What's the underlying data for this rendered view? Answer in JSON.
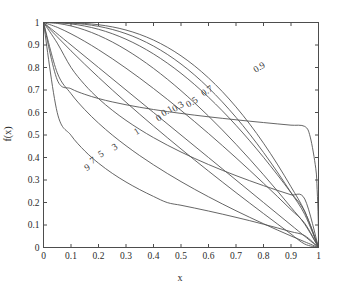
{
  "chart_data": {
    "type": "line",
    "title": "",
    "xlabel": "x",
    "ylabel": "f(x)",
    "xlim": [
      0,
      1
    ],
    "ylim": [
      0,
      1
    ],
    "grid": false,
    "legend": "inline-curve-labels",
    "xticks": [
      "0",
      "0.1",
      "0.2",
      "0.3",
      "0.4",
      "0.5",
      "0.6",
      "0.7",
      "0.8",
      "0.9",
      "1"
    ],
    "xtick_values": [
      0,
      0.1,
      0.2,
      0.3,
      0.4,
      0.5,
      0.6,
      0.7,
      0.8,
      0.9,
      1
    ],
    "yticks": [
      "0",
      "0.1",
      "0.2",
      "0.3",
      "0.4",
      "0.5",
      "0.6",
      "0.7",
      "0.8",
      "0.9",
      "1"
    ],
    "ytick_values": [
      0,
      0.1,
      0.2,
      0.3,
      0.4,
      0.5,
      0.6,
      0.7,
      0.8,
      0.9,
      1
    ],
    "line_color": "#555555",
    "series": [
      {
        "name": "0.9",
        "param": 0.9,
        "exponent": 0.1,
        "label_x": 0.79,
        "label_y": 0.79,
        "values": [
          [
            0,
            1
          ],
          [
            0.05,
            0.745
          ],
          [
            0.1,
            0.7057
          ],
          [
            0.15,
            0.6808
          ],
          [
            0.2,
            0.6621
          ],
          [
            0.25,
            0.6471
          ],
          [
            0.3,
            0.6343
          ],
          [
            0.35,
            0.6232
          ],
          [
            0.4,
            0.6132
          ],
          [
            0.45,
            0.6042
          ],
          [
            0.5,
            0.5959
          ],
          [
            0.55,
            0.5882
          ],
          [
            0.6,
            0.5809
          ],
          [
            0.65,
            0.5741
          ],
          [
            0.7,
            0.5676
          ],
          [
            0.75,
            0.5613
          ],
          [
            0.8,
            0.5553
          ],
          [
            0.85,
            0.5494
          ],
          [
            0.9,
            0.5437
          ],
          [
            0.95,
            0.5381
          ],
          [
            0.97,
            0.4909
          ],
          [
            0.99,
            0.3521
          ],
          [
            0.995,
            0.2583
          ],
          [
            0.999,
            0.1262
          ],
          [
            1,
            0
          ]
        ]
      },
      {
        "name": "0.7",
        "param": 0.7,
        "exponent": 0.3,
        "label_x": 0.6,
        "label_y": 0.685,
        "values": [
          [
            0,
            1
          ],
          [
            0.05,
            0.5994
          ],
          [
            0.1,
            0.4988
          ],
          [
            0.15,
            0.4292
          ],
          [
            0.2,
            0.3748
          ],
          [
            0.25,
            0.3297
          ],
          [
            0.3,
            0.2911
          ],
          [
            0.35,
            0.2572
          ],
          [
            0.4,
            0.227
          ],
          [
            0.45,
            0.1997
          ],
          [
            0.5,
            0.1878
          ],
          [
            0.55,
            0.1752
          ],
          [
            0.6,
            0.1621
          ],
          [
            0.65,
            0.1484
          ],
          [
            0.7,
            0.1341
          ],
          [
            0.75,
            0.1192
          ],
          [
            0.8,
            0.1036
          ],
          [
            0.85,
            0.0873
          ],
          [
            0.9,
            0.0703
          ],
          [
            0.95,
            0.0525
          ],
          [
            1,
            0
          ]
        ]
      },
      {
        "name": "0.5",
        "param": 0.5,
        "exponent": 0.5,
        "label_x": 0.545,
        "label_y": 0.635,
        "values": [
          [
            0,
            1
          ],
          [
            0.05,
            0.7764
          ],
          [
            0.1,
            0.6838
          ],
          [
            0.15,
            0.6127
          ],
          [
            0.2,
            0.5528
          ],
          [
            0.25,
            0.5
          ],
          [
            0.3,
            0.4523
          ],
          [
            0.35,
            0.4083
          ],
          [
            0.4,
            0.3675
          ],
          [
            0.45,
            0.3292
          ],
          [
            0.5,
            0.2929
          ],
          [
            0.55,
            0.2584
          ],
          [
            0.6,
            0.2254
          ],
          [
            0.65,
            0.1938
          ],
          [
            0.7,
            0.1633
          ],
          [
            0.75,
            0.134
          ],
          [
            0.8,
            0.1056
          ],
          [
            0.85,
            0.078
          ],
          [
            0.9,
            0.0513
          ],
          [
            0.95,
            0.0253
          ],
          [
            1,
            0
          ]
        ]
      },
      {
        "name": "0.3",
        "param": 0.3,
        "exponent": 0.7,
        "label_x": 0.495,
        "label_y": 0.615,
        "values": [
          [
            0,
            1
          ],
          [
            0.05,
            0.9083
          ],
          [
            0.1,
            0.8005
          ],
          [
            0.15,
            0.7234
          ],
          [
            0.2,
            0.6619
          ],
          [
            0.25,
            0.6101
          ],
          [
            0.3,
            0.565
          ],
          [
            0.35,
            0.5248
          ],
          [
            0.4,
            0.4884
          ],
          [
            0.45,
            0.4551
          ],
          [
            0.5,
            0.4243
          ],
          [
            0.55,
            0.3956
          ],
          [
            0.6,
            0.3687
          ],
          [
            0.65,
            0.3434
          ],
          [
            0.7,
            0.3194
          ],
          [
            0.75,
            0.2966
          ],
          [
            0.8,
            0.2749
          ],
          [
            0.85,
            0.2542
          ],
          [
            0.9,
            0.2344
          ],
          [
            0.95,
            0.2154
          ],
          [
            1,
            0
          ]
        ]
      },
      {
        "name": "0.1",
        "param": 0.1,
        "exponent": 0.9,
        "label_x": 0.455,
        "label_y": 0.595,
        "values": [
          [
            0,
            1
          ],
          [
            0.05,
            0.9363
          ],
          [
            0.1,
            0.8741
          ],
          [
            0.15,
            0.8143
          ],
          [
            0.2,
            0.7565
          ],
          [
            0.25,
            0.7003
          ],
          [
            0.3,
            0.6456
          ],
          [
            0.35,
            0.5921
          ],
          [
            0.4,
            0.5398
          ],
          [
            0.45,
            0.4885
          ],
          [
            0.5,
            0.438
          ],
          [
            0.55,
            0.3884
          ],
          [
            0.6,
            0.3396
          ],
          [
            0.65,
            0.2915
          ],
          [
            0.7,
            0.244
          ],
          [
            0.75,
            0.1972
          ],
          [
            0.8,
            0.1509
          ],
          [
            0.85,
            0.1052
          ],
          [
            0.9,
            0.06
          ],
          [
            0.95,
            0.0153
          ],
          [
            1,
            0
          ]
        ]
      },
      {
        "name": "0",
        "param": 0,
        "exponent": 1.0,
        "label_x": 0.425,
        "label_y": 0.565,
        "values": [
          [
            0,
            1
          ],
          [
            0.1,
            0.9
          ],
          [
            0.2,
            0.8
          ],
          [
            0.3,
            0.7
          ],
          [
            0.4,
            0.6
          ],
          [
            0.5,
            0.5
          ],
          [
            0.6,
            0.4
          ],
          [
            0.7,
            0.3
          ],
          [
            0.8,
            0.2
          ],
          [
            0.9,
            0.1
          ],
          [
            1,
            0
          ]
        ]
      },
      {
        "name": "1",
        "param": 1,
        "exponent": 1.45,
        "label_x": 0.345,
        "label_y": 0.505,
        "values": [
          [
            0,
            1
          ],
          [
            0.05,
            0.9786
          ],
          [
            0.1,
            0.9497
          ],
          [
            0.15,
            0.9161
          ],
          [
            0.2,
            0.879
          ],
          [
            0.25,
            0.8391
          ],
          [
            0.3,
            0.7969
          ],
          [
            0.35,
            0.7527
          ],
          [
            0.4,
            0.7066
          ],
          [
            0.45,
            0.6589
          ],
          [
            0.5,
            0.6096
          ],
          [
            0.55,
            0.5589
          ],
          [
            0.6,
            0.5068
          ],
          [
            0.65,
            0.4534
          ],
          [
            0.7,
            0.3987
          ],
          [
            0.75,
            0.3428
          ],
          [
            0.8,
            0.2857
          ],
          [
            0.85,
            0.2274
          ],
          [
            0.9,
            0.168
          ],
          [
            0.95,
            0.1074
          ],
          [
            1,
            0
          ]
        ]
      },
      {
        "name": "3",
        "param": 3,
        "exponent": 2.1,
        "label_x": 0.265,
        "label_y": 0.435,
        "values": [
          [
            0,
            1
          ],
          [
            0.05,
            0.996
          ],
          [
            0.1,
            0.9847
          ],
          [
            0.15,
            0.9668
          ],
          [
            0.2,
            0.9429
          ],
          [
            0.25,
            0.9135
          ],
          [
            0.3,
            0.8789
          ],
          [
            0.35,
            0.8397
          ],
          [
            0.4,
            0.7961
          ],
          [
            0.45,
            0.7484
          ],
          [
            0.5,
            0.697
          ],
          [
            0.55,
            0.6421
          ],
          [
            0.6,
            0.584
          ],
          [
            0.65,
            0.5228
          ],
          [
            0.7,
            0.4589
          ],
          [
            0.75,
            0.3923
          ],
          [
            0.8,
            0.3233
          ],
          [
            0.85,
            0.2521
          ],
          [
            0.9,
            0.1787
          ],
          [
            0.95,
            0.1034
          ],
          [
            1,
            0
          ]
        ]
      },
      {
        "name": "5",
        "param": 5,
        "exponent": 2.7,
        "label_x": 0.215,
        "label_y": 0.405,
        "values": [
          [
            0,
            1
          ],
          [
            0.05,
            0.9989
          ],
          [
            0.1,
            0.9938
          ],
          [
            0.15,
            0.9842
          ],
          [
            0.2,
            0.9698
          ],
          [
            0.25,
            0.9503
          ],
          [
            0.3,
            0.9256
          ],
          [
            0.35,
            0.8956
          ],
          [
            0.4,
            0.8603
          ],
          [
            0.45,
            0.8198
          ],
          [
            0.5,
            0.7742
          ],
          [
            0.55,
            0.7235
          ],
          [
            0.6,
            0.668
          ],
          [
            0.65,
            0.6078
          ],
          [
            0.7,
            0.5431
          ],
          [
            0.75,
            0.4741
          ],
          [
            0.8,
            0.401
          ],
          [
            0.85,
            0.324
          ],
          [
            0.9,
            0.2434
          ],
          [
            0.95,
            0.1594
          ],
          [
            1,
            0
          ]
        ]
      },
      {
        "name": "7",
        "param": 7,
        "exponent": 3.3,
        "label_x": 0.185,
        "label_y": 0.375,
        "values": [
          [
            0,
            1
          ],
          [
            0.05,
            0.9996
          ],
          [
            0.1,
            0.9973
          ],
          [
            0.15,
            0.992
          ],
          [
            0.2,
            0.9829
          ],
          [
            0.25,
            0.9692
          ],
          [
            0.3,
            0.9503
          ],
          [
            0.35,
            0.9258
          ],
          [
            0.4,
            0.8953
          ],
          [
            0.45,
            0.8586
          ],
          [
            0.5,
            0.8155
          ],
          [
            0.55,
            0.7659
          ],
          [
            0.6,
            0.7098
          ],
          [
            0.65,
            0.6473
          ],
          [
            0.7,
            0.5785
          ],
          [
            0.75,
            0.5035
          ],
          [
            0.8,
            0.4226
          ],
          [
            0.85,
            0.336
          ],
          [
            0.9,
            0.244
          ],
          [
            0.95,
            0.1469
          ],
          [
            1,
            0
          ]
        ]
      },
      {
        "name": "9",
        "param": 9,
        "exponent": 3.9,
        "label_x": 0.165,
        "label_y": 0.345,
        "values": [
          [
            0,
            1
          ],
          [
            0.05,
            0.9998
          ],
          [
            0.1,
            0.9988
          ],
          [
            0.15,
            0.9958
          ],
          [
            0.2,
            0.9901
          ],
          [
            0.25,
            0.9806
          ],
          [
            0.3,
            0.9665
          ],
          [
            0.35,
            0.9471
          ],
          [
            0.4,
            0.9219
          ],
          [
            0.45,
            0.8903
          ],
          [
            0.5,
            0.852
          ],
          [
            0.55,
            0.8066
          ],
          [
            0.6,
            0.7537
          ],
          [
            0.65,
            0.6932
          ],
          [
            0.7,
            0.6248
          ],
          [
            0.75,
            0.5483
          ],
          [
            0.8,
            0.4637
          ],
          [
            0.85,
            0.3709
          ],
          [
            0.9,
            0.2698
          ],
          [
            0.95,
            0.1605
          ],
          [
            1,
            0
          ]
        ]
      }
    ]
  },
  "axes": {
    "x_title": "x",
    "y_title": "f(x)"
  }
}
